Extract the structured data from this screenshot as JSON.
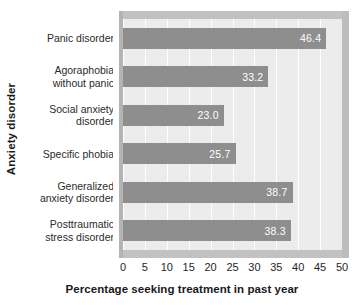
{
  "chart_data": {
    "type": "bar",
    "orientation": "horizontal",
    "title": "",
    "xlabel": "Percentage seeking treatment in past year",
    "ylabel": "Anxiety disorder",
    "categories": [
      "Panic disorder",
      "Agoraphobia without panic",
      "Social anxiety disorder",
      "Specific phobia",
      "Generalized anxiety disorder",
      "Posttraumatic stress disorder"
    ],
    "category_lines": [
      [
        "Panic disorder"
      ],
      [
        "Agoraphobia",
        "without panic"
      ],
      [
        "Social anxiety",
        "disorder"
      ],
      [
        "Specific phobia"
      ],
      [
        "Generalized",
        "anxiety disorder"
      ],
      [
        "Posttraumatic",
        "stress disorder"
      ]
    ],
    "values": [
      46.4,
      33.2,
      23.0,
      25.7,
      38.7,
      38.3
    ],
    "value_labels": [
      "46.4",
      "33.2",
      "23.0",
      "25.7",
      "38.7",
      "38.3"
    ],
    "xlim": [
      0,
      50
    ],
    "xticks": [
      0,
      5,
      10,
      15,
      20,
      25,
      30,
      35,
      40,
      45,
      50
    ],
    "xtick_labels": [
      "0",
      "5",
      "10",
      "15",
      "20",
      "25",
      "30",
      "35",
      "40",
      "45",
      "50"
    ],
    "grid": "vertical",
    "legend": null,
    "colors": {
      "bar": "#8e8e8e",
      "plot_background": "#ececec",
      "gridline": "#ffffff",
      "frame_band": "#c2c2c2",
      "value_label": "#ffffff",
      "axis_text": "#1f1f1f",
      "page_background": "#ffffff"
    }
  }
}
